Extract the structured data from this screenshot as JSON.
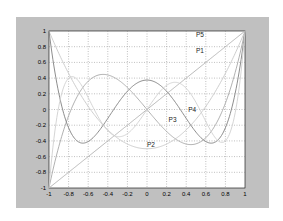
{
  "chart_data": {
    "type": "line",
    "title": "",
    "xlabel": "",
    "ylabel": "",
    "xlim": [
      -1,
      1
    ],
    "ylim": [
      -1,
      1
    ],
    "grid": true,
    "xticks": [
      "-1",
      "-0.8",
      "-0.6",
      "-0.4",
      "-0.2",
      "0",
      "0.2",
      "0.4",
      "0.6",
      "0.8",
      "1"
    ],
    "yticks": [
      "1",
      "0.8",
      "0.6",
      "0.4",
      "0.2",
      "0",
      "-0.2",
      "-0.4",
      "-0.6",
      "-0.8",
      "-1"
    ],
    "series": [
      {
        "name": "P1",
        "label_pos": [
          0.5,
          0.75
        ],
        "color": "#b0b0b0",
        "x": [
          -1,
          -0.5,
          0,
          0.5,
          1
        ],
        "y": [
          -1,
          -0.5,
          0,
          0.5,
          1
        ]
      },
      {
        "name": "P2",
        "label_pos": [
          0.0,
          -0.45
        ],
        "color": "#c8c8c8",
        "x": [
          -1,
          -0.8,
          -0.6,
          -0.4,
          -0.2,
          0,
          0.2,
          0.4,
          0.6,
          0.8,
          1
        ],
        "y": [
          1,
          0.46,
          0.04,
          -0.26,
          -0.44,
          -0.5,
          -0.44,
          -0.26,
          0.04,
          0.46,
          1
        ]
      },
      {
        "name": "P3",
        "label_pos": [
          0.22,
          -0.14
        ],
        "color": "#a8a8a8",
        "x": [
          -1,
          -0.8,
          -0.6,
          -0.4,
          -0.2,
          0,
          0.2,
          0.4,
          0.6,
          0.8,
          1
        ],
        "y": [
          -1,
          -0.08,
          0.36,
          0.44,
          0.28,
          0,
          -0.28,
          -0.44,
          -0.36,
          0.08,
          1
        ]
      },
      {
        "name": "P4",
        "label_pos": [
          0.42,
          0.0
        ],
        "color": "#808080",
        "x": [
          -1,
          -0.8,
          -0.6,
          -0.4,
          -0.2,
          0,
          0.2,
          0.4,
          0.6,
          0.8,
          1
        ],
        "y": [
          1,
          -0.23,
          -0.41,
          -0.11,
          0.23,
          0.375,
          0.23,
          -0.11,
          -0.41,
          -0.23,
          1
        ]
      },
      {
        "name": "P5",
        "label_pos": [
          0.5,
          0.95
        ],
        "color": "#d0d0d0",
        "x": [
          -1,
          -0.8,
          -0.6,
          -0.4,
          -0.2,
          0,
          0.2,
          0.4,
          0.6,
          0.8,
          1
        ],
        "y": [
          -1,
          0.04,
          -0.15,
          0.35,
          0.31,
          0,
          -0.31,
          -0.35,
          0.15,
          -0.04,
          1
        ]
      }
    ]
  },
  "figure": {
    "background": "#c0c0c0",
    "axes_background": "#ffffff",
    "grid_color": "#808080"
  }
}
